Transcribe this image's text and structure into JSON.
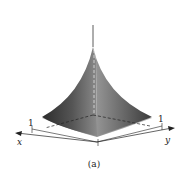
{
  "figure": {
    "caption": "(a)",
    "axes": {
      "x": {
        "label": "x",
        "tick_label": "1"
      },
      "y": {
        "label": "y",
        "tick_label": "1"
      },
      "z": {
        "label": ""
      }
    },
    "surface": {
      "description": "Cusp-shaped surface over unit square rising to a peak on the z-axis",
      "colors": {
        "dark": "#2a2a2a",
        "mid": "#7a7a7a",
        "light": "#d0d0d0"
      }
    }
  }
}
